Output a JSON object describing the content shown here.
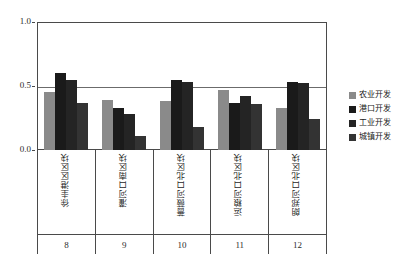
{
  "chart_data": {
    "type": "bar",
    "title": "",
    "subtitle": "",
    "xlabel": "",
    "ylabel": "",
    "ylim": [
      0.0,
      1.0
    ],
    "grid": true,
    "legend_position": "right",
    "categories": [
      "徐圭港区区块",
      "灌河口南区块",
      "蔷薇河口北区块",
      "运粮河口北区块",
      "朗郑河口北区块"
    ],
    "category_numbers": [
      "8",
      "9",
      "10",
      "11",
      "12"
    ],
    "ytick_labels": [
      "0.0",
      "0.5",
      "1.0"
    ],
    "ytick_values": [
      0.0,
      0.5,
      1.0
    ],
    "series": [
      {
        "name": "农业开发",
        "color": "#8a8a8a",
        "values": [
          0.45,
          0.39,
          0.38,
          0.47,
          0.33
        ]
      },
      {
        "name": "港口开发",
        "color": "#1a1a1a",
        "values": [
          0.6,
          0.33,
          0.55,
          0.37,
          0.53
        ]
      },
      {
        "name": "工业开发",
        "color": "#242424",
        "values": [
          0.55,
          0.28,
          0.53,
          0.42,
          0.52
        ]
      },
      {
        "name": "城镇开发",
        "color": "#333333",
        "values": [
          0.37,
          0.11,
          0.18,
          0.36,
          0.24
        ]
      }
    ]
  },
  "legend": {
    "items": [
      {
        "label": "农业开发",
        "color": "#8a8a8a"
      },
      {
        "label": "港口开发",
        "color": "#1a1a1a"
      },
      {
        "label": "工业开发",
        "color": "#242424"
      },
      {
        "label": "城镇开发",
        "color": "#333333"
      }
    ]
  },
  "colors": {
    "axis": "#4a4a4a",
    "grid": "#6b6b6b",
    "text": "#1f1f1f",
    "background": "#ffffff"
  }
}
